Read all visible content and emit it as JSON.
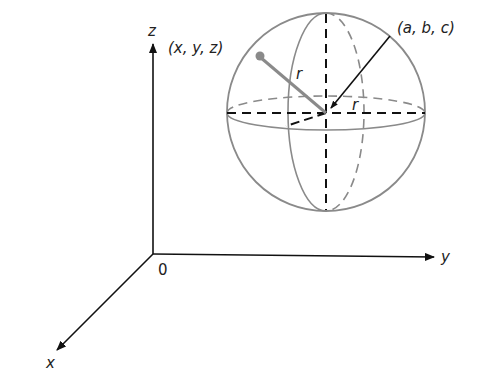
{
  "figure": {
    "axes": {
      "z_label": "z",
      "y_label": "y",
      "x_label": "x",
      "origin_label": "0"
    },
    "sphere": {
      "center_label": "(a, b, c)",
      "point_label": "(x, y, z)",
      "radius_label_1": "r",
      "radius_label_2": "r"
    },
    "colors": {
      "axes": "#111111",
      "sphere": "#8a8a8a",
      "dashed": "#111111"
    }
  }
}
